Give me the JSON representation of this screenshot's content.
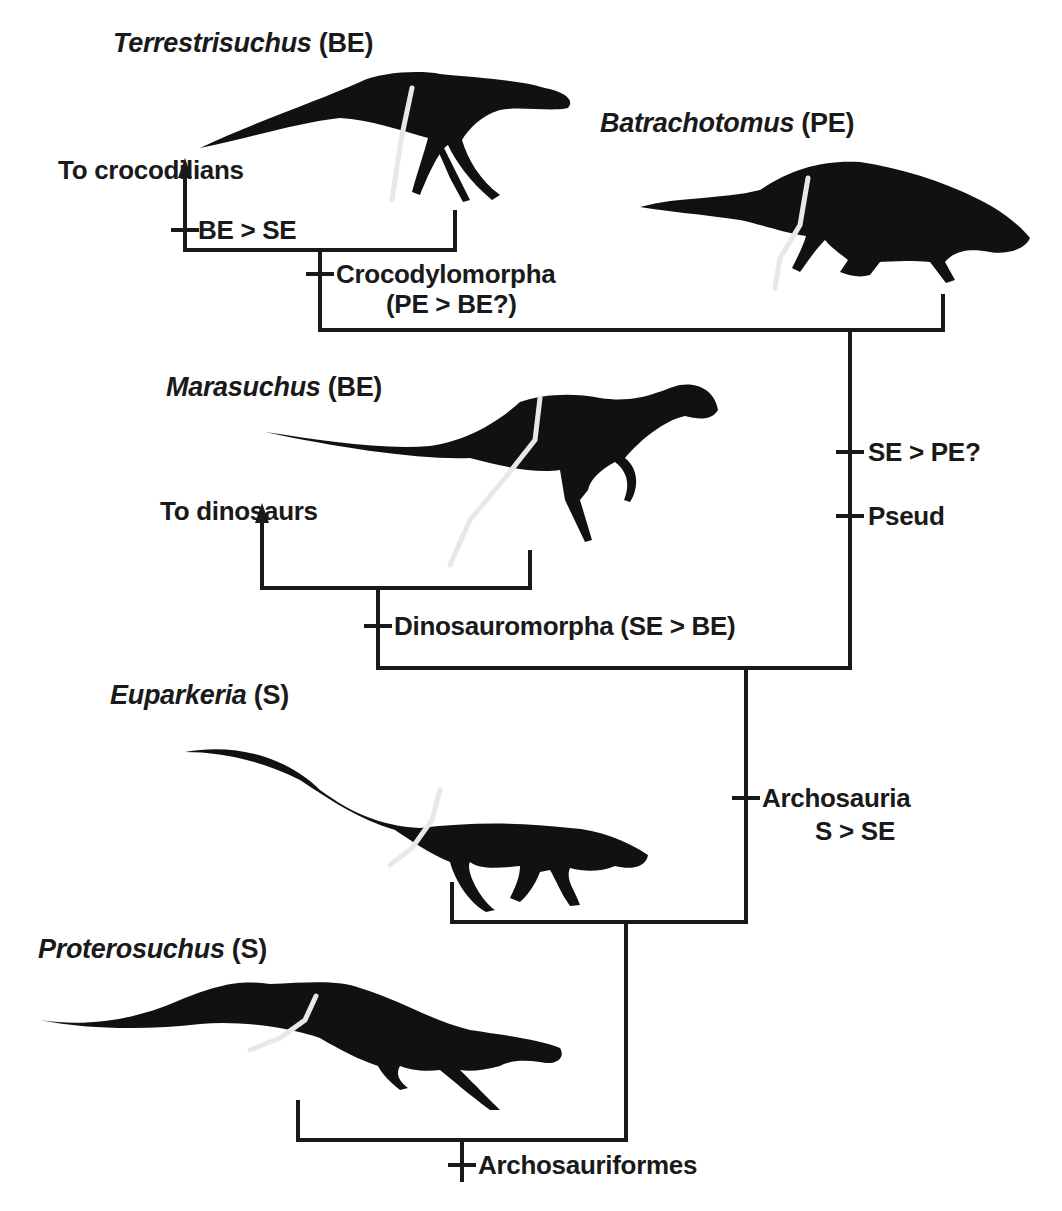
{
  "diagram": {
    "type": "cladogram",
    "line_color": "#1a1a1a",
    "silhouette_color": "#111111",
    "limb_highlight_color": "#e8e8e8"
  },
  "taxa": [
    {
      "genus": "Terrestrisuchus",
      "code": "(BE)"
    },
    {
      "genus": "Batrachotomus",
      "code": "(PE)"
    },
    {
      "genus": "Marasuchus",
      "code": "(BE)"
    },
    {
      "genus": "Euparkeria",
      "code": "(S)"
    },
    {
      "genus": "Proterosuchus",
      "code": "(S)"
    }
  ],
  "lineage_arrows": [
    {
      "label": "To crocodilians"
    },
    {
      "label": "To dinosaurs"
    }
  ],
  "node_labels": {
    "be_se": "BE > SE",
    "crocodylomorpha": "Crocodylomorpha",
    "crocodylomorpha_note": "(PE > BE?)",
    "se_pe": "SE > PE?",
    "pseud": "Pseud",
    "dinosauromorpha": "Dinosauromorpha (SE > BE)",
    "archosauria": "Archosauria",
    "archosauria_note": "S > SE",
    "archosauriformes": "Archosauriformes"
  }
}
